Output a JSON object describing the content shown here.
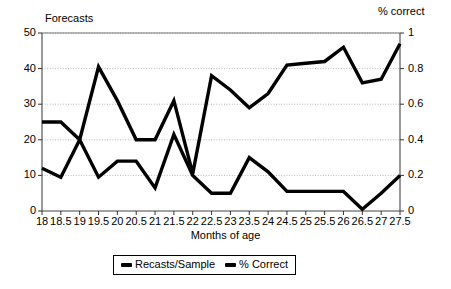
{
  "chart_data": {
    "type": "line",
    "title": "",
    "xlabel": "Months of age",
    "ylabel": "Forecasts",
    "y2label": "% correct",
    "categories": [
      "18",
      "18.5",
      "19",
      "19.5",
      "20",
      "20.5",
      "21",
      "21.5",
      "22",
      "22.5",
      "23",
      "23.5",
      "24",
      "24.5",
      "25",
      "25.5",
      "26",
      "26.5",
      "27",
      "27.5"
    ],
    "ylim": [
      0,
      50
    ],
    "y2lim": [
      0,
      1
    ],
    "yticks": [
      "0",
      "10",
      "20",
      "30",
      "40",
      "50"
    ],
    "y2ticks": [
      "0",
      "0.2",
      "0.4",
      "0.6",
      "0.8",
      "1"
    ],
    "grid": true,
    "legend_position": "bottom",
    "series": [
      {
        "name": "Recasts/Sample",
        "axis": "left",
        "color": "#000000",
        "values": [
          25,
          25,
          20,
          40.5,
          31,
          20,
          20,
          31,
          10.5,
          38,
          34,
          29,
          33,
          41,
          41.5,
          42,
          46,
          36,
          37,
          47
        ]
      },
      {
        "name": "% Correct",
        "axis": "right",
        "color": "#000000",
        "values": [
          0.24,
          0.19,
          0.4,
          0.19,
          0.28,
          0.28,
          0.13,
          0.43,
          0.2,
          0.1,
          0.1,
          0.3,
          0.22,
          0.11,
          0.11,
          0.11,
          0.11,
          0.01,
          0.1,
          0.2
        ]
      }
    ]
  },
  "axes": {
    "left_title": "Forecasts",
    "right_title": "% correct",
    "x_title": "Months of age"
  },
  "legend": {
    "items": [
      {
        "label": "Recasts/Sample"
      },
      {
        "label": "% Correct"
      }
    ]
  }
}
